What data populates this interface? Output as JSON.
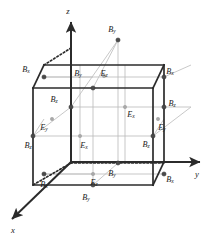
{
  "figure": {
    "type": "diagram"
  },
  "colors": {
    "edge_solid": "#2b2b2b",
    "edge_hidden": "#2b2b2b",
    "grid_line": "#b9b9b9",
    "diagonal_line": "#c2c2c2",
    "node_dark": "#4a4a4a",
    "node_light": "#a8a8a8",
    "text": "#1b1b1b",
    "background": "#ffffff"
  },
  "axes": [
    {
      "id": "axis-z",
      "label": "z",
      "label_x": 68,
      "label_y": 12,
      "x1": 71,
      "y1": 162,
      "x2": 71,
      "y2": 22
    },
    {
      "id": "axis-y",
      "label": "y",
      "label_x": 197,
      "label_y": 175,
      "x1": 71,
      "y1": 162,
      "x2": 200,
      "y2": 162
    },
    {
      "id": "axis-x",
      "label": "x",
      "label_x": 13,
      "label_y": 231,
      "x1": 71,
      "y1": 162,
      "x2": 12,
      "y2": 219
    }
  ],
  "cube": {
    "front_face": [
      [
        33,
        88
      ],
      [
        153,
        88
      ],
      [
        153,
        185
      ],
      [
        33,
        185
      ]
    ],
    "back_face": [
      [
        71,
        65
      ],
      [
        191,
        65
      ],
      [
        191,
        162
      ],
      [
        71,
        162
      ]
    ],
    "solid_edges": [
      [
        33,
        88,
        153,
        88
      ],
      [
        153,
        88,
        153,
        185
      ],
      [
        33,
        185,
        153,
        185
      ],
      [
        33,
        88,
        33,
        185
      ],
      [
        44,
        65,
        164,
        65
      ],
      [
        164,
        65,
        164,
        162
      ],
      [
        33,
        88,
        44,
        65
      ],
      [
        153,
        88,
        164,
        65
      ],
      [
        153,
        185,
        164,
        162
      ]
    ],
    "hidden_edges": [
      [
        44,
        65,
        71,
        48
      ],
      [
        71,
        48,
        71,
        163
      ],
      [
        71,
        163,
        164,
        163
      ],
      [
        71,
        163,
        33,
        185
      ]
    ]
  },
  "components": [
    {
      "id": "n1",
      "label": "B",
      "sub": "y",
      "node_x": 118,
      "node_y": 40,
      "text_x": 112,
      "text_y": 30,
      "tone": "dark"
    },
    {
      "id": "n2",
      "label": "B",
      "sub": "x",
      "node_x": 44,
      "node_y": 77,
      "text_x": 26,
      "text_y": 70,
      "tone": "dark"
    },
    {
      "id": "n3",
      "label": "B",
      "sub": "x",
      "node_x": 164,
      "node_y": 77,
      "text_x": 170,
      "text_y": 72,
      "tone": "dark"
    },
    {
      "id": "n4",
      "label": "B",
      "sub": "y",
      "node_x": 93,
      "node_y": 88,
      "text_x": 78,
      "text_y": 74,
      "tone": "dark"
    },
    {
      "id": "n5",
      "label": "E",
      "sub": "z",
      "node_x": 104,
      "node_y": 76,
      "text_x": 104,
      "text_y": 74,
      "tone": "light"
    },
    {
      "id": "n6",
      "label": "B",
      "sub": "z",
      "node_x": 71,
      "node_y": 107,
      "text_x": 54,
      "text_y": 100,
      "tone": "dark"
    },
    {
      "id": "n7",
      "label": "B",
      "sub": "z",
      "node_x": 164,
      "node_y": 107,
      "text_x": 172,
      "text_y": 104,
      "tone": "dark"
    },
    {
      "id": "n8",
      "label": "E",
      "sub": "x",
      "node_x": 125,
      "node_y": 107,
      "text_x": 131,
      "text_y": 115,
      "tone": "light"
    },
    {
      "id": "n9",
      "label": "E",
      "sub": "y",
      "node_x": 52,
      "node_y": 119,
      "text_x": 44,
      "text_y": 128,
      "tone": "light"
    },
    {
      "id": "n10",
      "label": "E",
      "sub": "y",
      "node_x": 158,
      "node_y": 119,
      "text_x": 162,
      "text_y": 128,
      "tone": "light"
    },
    {
      "id": "n11",
      "label": "B",
      "sub": "z",
      "node_x": 33,
      "node_y": 136,
      "text_x": 28,
      "text_y": 146,
      "tone": "dark"
    },
    {
      "id": "n12",
      "label": "B",
      "sub": "z",
      "node_x": 153,
      "node_y": 136,
      "text_x": 146,
      "text_y": 145,
      "tone": "dark"
    },
    {
      "id": "n13",
      "label": "E",
      "sub": "x",
      "node_x": 80,
      "node_y": 136,
      "text_x": 84,
      "text_y": 146,
      "tone": "light"
    },
    {
      "id": "n14",
      "label": "B",
      "sub": "y",
      "node_x": 118,
      "node_y": 163,
      "text_x": 112,
      "text_y": 174,
      "tone": "dark"
    },
    {
      "id": "n15",
      "label": "B",
      "sub": "x",
      "node_x": 44,
      "node_y": 174,
      "text_x": 44,
      "text_y": 185,
      "tone": "dark"
    },
    {
      "id": "n16",
      "label": "B",
      "sub": "x",
      "node_x": 164,
      "node_y": 174,
      "text_x": 170,
      "text_y": 180,
      "tone": "dark"
    },
    {
      "id": "n17",
      "label": "E",
      "sub": "z",
      "node_x": 93,
      "node_y": 174,
      "text_x": 94,
      "text_y": 183,
      "tone": "light"
    },
    {
      "id": "n18",
      "label": "B",
      "sub": "y",
      "node_x": 93,
      "node_y": 185,
      "text_x": 86,
      "text_y": 198,
      "tone": "dark"
    }
  ],
  "interior_grid": [
    [
      33,
      136,
      153,
      136
    ],
    [
      44,
      77,
      164,
      77
    ],
    [
      44,
      174,
      164,
      174
    ],
    [
      71,
      107,
      191,
      107
    ],
    [
      93,
      88,
      93,
      185
    ],
    [
      118,
      40,
      118,
      163
    ],
    [
      125,
      65,
      125,
      162
    ],
    [
      80,
      65,
      80,
      162
    ],
    [
      153,
      136,
      164,
      119
    ],
    [
      33,
      136,
      44,
      119
    ]
  ],
  "diagonals": [
    [
      33,
      136,
      71,
      107
    ],
    [
      71,
      107,
      118,
      40
    ],
    [
      153,
      136,
      191,
      107
    ],
    [
      33,
      185,
      71,
      163
    ],
    [
      93,
      185,
      118,
      163
    ],
    [
      44,
      174,
      93,
      174
    ],
    [
      93,
      88,
      118,
      40
    ],
    [
      44,
      77,
      93,
      77
    ],
    [
      164,
      77,
      191,
      65
    ]
  ]
}
